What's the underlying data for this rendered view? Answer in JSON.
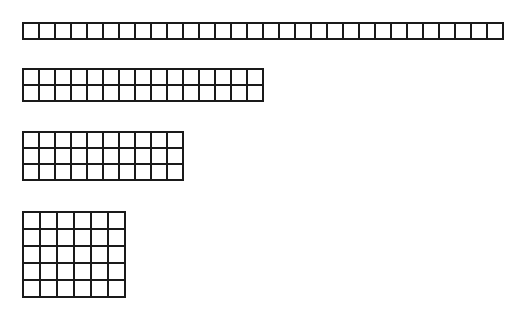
{
  "page": {
    "background_color": "#ffffff",
    "line_color": "#1a1a1a",
    "cell_fill_color": "#ffffff",
    "width": 516,
    "height": 317
  },
  "chart_data": {
    "type": "table",
    "subtitle": "",
    "xlabel": "",
    "ylabel": "",
    "total_squares": 30,
    "categories": [
      "30 x 1",
      "15 x 2",
      "10 x 3",
      "6 x 5"
    ],
    "values": [
      30,
      30,
      30,
      30
    ],
    "series": [
      {
        "name": "columns",
        "values": [
          30,
          15,
          10,
          6
        ]
      },
      {
        "name": "rows",
        "values": [
          1,
          2,
          3,
          5
        ]
      }
    ],
    "arrays": [
      {
        "label": "30 x 1",
        "columns": 30,
        "rows": 1,
        "cell_count": 30,
        "cell_width": 14,
        "cell_height": 14
      },
      {
        "label": "15 x 2",
        "columns": 15,
        "rows": 2,
        "cell_count": 30,
        "cell_width": 14,
        "cell_height": 14
      },
      {
        "label": "10 x 3",
        "columns": 10,
        "rows": 3,
        "cell_count": 30,
        "cell_width": 14,
        "cell_height": 14
      },
      {
        "label": "6 x 5",
        "columns": 6,
        "rows": 5,
        "cell_count": 30,
        "cell_width": 15,
        "cell_height": 15
      }
    ],
    "grid": true,
    "legend": "none"
  }
}
